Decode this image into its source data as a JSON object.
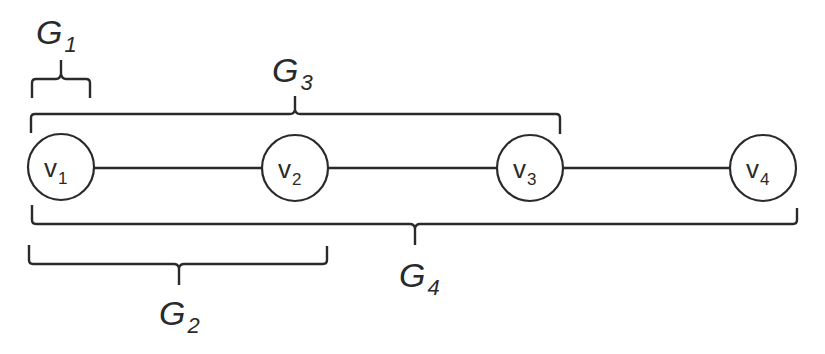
{
  "diagram": {
    "type": "path-graph-with-nested-groups",
    "nodes": [
      {
        "id": "v1",
        "base": "v",
        "sub": "1"
      },
      {
        "id": "v2",
        "base": "v",
        "sub": "2"
      },
      {
        "id": "v3",
        "base": "v",
        "sub": "3"
      },
      {
        "id": "v4",
        "base": "v",
        "sub": "4"
      }
    ],
    "edges": [
      {
        "from": "v1",
        "to": "v2"
      },
      {
        "from": "v2",
        "to": "v3"
      },
      {
        "from": "v3",
        "to": "v4"
      }
    ],
    "groups": [
      {
        "id": "G1",
        "base": "G",
        "sub": "1",
        "covers": [
          "v1"
        ],
        "position": "above"
      },
      {
        "id": "G2",
        "base": "G",
        "sub": "2",
        "covers": [
          "v1",
          "v2"
        ],
        "position": "below"
      },
      {
        "id": "G3",
        "base": "G",
        "sub": "3",
        "covers": [
          "v1",
          "v2",
          "v3"
        ],
        "position": "above"
      },
      {
        "id": "G4",
        "base": "G",
        "sub": "4",
        "covers": [
          "v1",
          "v2",
          "v3",
          "v4"
        ],
        "position": "below"
      }
    ],
    "colors": {
      "stroke": "#2a2a2a",
      "background": "#ffffff"
    }
  }
}
